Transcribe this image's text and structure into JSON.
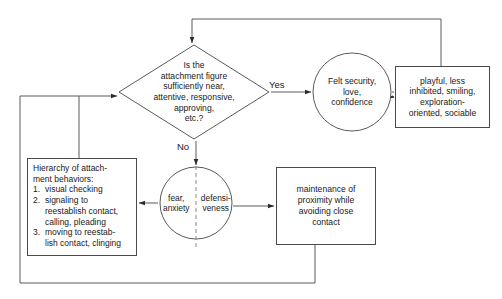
{
  "diagram": {
    "stroke_color": "#4a4a4a",
    "text_color": "#1a1a1a",
    "background": "#ffffff"
  },
  "decision": {
    "line1": "Is the",
    "line2": "attachment figure",
    "line3": "sufficiently near,",
    "line4": "attentive, responsive,",
    "line5": "approving,",
    "line6": "etc.?"
  },
  "labels": {
    "yes": "Yes",
    "no": "No"
  },
  "felt_security": {
    "line1": "Felt security,",
    "line2": "love,",
    "line3": "confidence"
  },
  "playful": {
    "line1": "playful, less",
    "line2": "inhibited, smiling,",
    "line3": "exploration-",
    "line4": "oriented, sociable"
  },
  "hierarchy": {
    "heading1": "Hierarchy of attach-",
    "heading2": "ment behaviors:",
    "items": [
      {
        "num": "1.",
        "lines": [
          "visual checking"
        ]
      },
      {
        "num": "2.",
        "lines": [
          "signaling to",
          "reestablish contact,",
          "calling, pleading"
        ]
      },
      {
        "num": "3.",
        "lines": [
          "moving to reestab-",
          "lish contact, clinging"
        ]
      }
    ]
  },
  "circle": {
    "left_line1": "fear,",
    "left_line2": "anxiety",
    "right_line1": "defensi-",
    "right_line2": "veness"
  },
  "maintenance": {
    "line1": "maintenance of",
    "line2": "proximity while",
    "line3": "avoiding close",
    "line4": "contact"
  }
}
